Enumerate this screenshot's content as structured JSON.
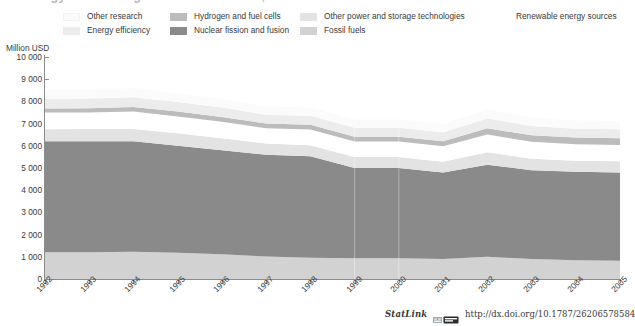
{
  "title": {
    "text": "Energy RD&D budgets in IEA countries, 1992-2005"
  },
  "legend": {
    "items": [
      {
        "label": "Other research",
        "color": "#fbfbfb",
        "col": 0,
        "row": 0,
        "swatch": true
      },
      {
        "label": "Energy efficiency",
        "color": "#ececec",
        "col": 0,
        "row": 1,
        "swatch": true
      },
      {
        "label": "Hydrogen and fuel cells",
        "color": "#bcbcbc",
        "col": 1,
        "row": 0,
        "swatch": true
      },
      {
        "label": "Nuclear fission and fusion",
        "color": "#8a8a8a",
        "col": 1,
        "row": 1,
        "swatch": true
      },
      {
        "label": "Other power and storage technologies",
        "color": "#e3e3e3",
        "col": 2,
        "row": 0,
        "swatch": true
      },
      {
        "label": "Fossil fuels",
        "color": "#d2d2d2",
        "col": 2,
        "row": 1,
        "swatch": true
      },
      {
        "label": "Renewable energy sources",
        "color": "#ffffff",
        "col": 3,
        "row": 0,
        "swatch": false
      }
    ]
  },
  "axes": {
    "y_title": "Million USD",
    "y_ticks": [
      "10 000",
      "9 000",
      "8 000",
      "7 000",
      "6 000",
      "5 000",
      "4 000",
      "3 000",
      "2 000",
      "1 000",
      "0"
    ],
    "y_min": 0,
    "y_max": 10000,
    "x_ticks": [
      "1992",
      "1993",
      "1994",
      "1995",
      "1996",
      "1997",
      "1998",
      "1999",
      "2000",
      "2001",
      "2002",
      "2003",
      "2004",
      "2005"
    ]
  },
  "footer": {
    "statlink_label": "StatLink",
    "url": "http://dx.doi.org/10.1787/262065785848"
  },
  "chart_data": {
    "type": "area",
    "title": "Energy RD&D budgets in IEA countries, 1992-2005",
    "xlabel": "",
    "ylabel": "Million USD",
    "ylim": [
      0,
      10000
    ],
    "grid": false,
    "legend_position": "top",
    "stacked": true,
    "x": [
      "1992",
      "1993",
      "1994",
      "1995",
      "1996",
      "1997",
      "1998",
      "1999",
      "2000",
      "2001",
      "2002",
      "2003",
      "2004",
      "2005"
    ],
    "series": [
      {
        "name": "Fossil fuels",
        "color": "#d2d2d2",
        "values": [
          1200,
          1210,
          1230,
          1180,
          1120,
          1010,
          960,
          930,
          930,
          900,
          1000,
          900,
          850,
          820
        ]
      },
      {
        "name": "Nuclear fission and fusion",
        "color": "#8a8a8a",
        "values": [
          5000,
          4990,
          4970,
          4820,
          4680,
          4590,
          4570,
          4070,
          4070,
          3900,
          4150,
          4000,
          3980,
          3980
        ]
      },
      {
        "name": "Other power and storage technologies",
        "color": "#e3e3e3",
        "values": [
          550,
          560,
          560,
          560,
          540,
          500,
          500,
          490,
          490,
          480,
          560,
          520,
          500,
          500
        ]
      },
      {
        "name": "Renewable energy sources",
        "color": "#ffffff",
        "values": [
          750,
          740,
          780,
          760,
          740,
          690,
          700,
          700,
          700,
          700,
          800,
          760,
          740,
          740
        ]
      },
      {
        "name": "Hydrogen and fuel cells",
        "color": "#bcbcbc",
        "values": [
          180,
          190,
          210,
          220,
          220,
          210,
          220,
          220,
          220,
          230,
          280,
          290,
          300,
          300
        ]
      },
      {
        "name": "Energy efficiency",
        "color": "#ececec",
        "values": [
          430,
          440,
          440,
          430,
          420,
          400,
          400,
          400,
          400,
          400,
          440,
          420,
          400,
          400
        ]
      },
      {
        "name": "Other research",
        "color": "#fbfbfb",
        "values": [
          390,
          400,
          400,
          390,
          380,
          370,
          370,
          370,
          370,
          370,
          400,
          380,
          370,
          370
        ]
      }
    ]
  }
}
